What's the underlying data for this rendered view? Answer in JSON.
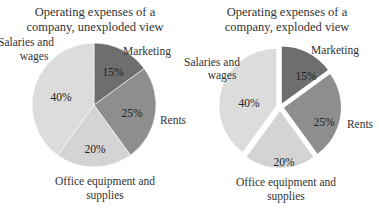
{
  "chart_data": [
    {
      "type": "pie",
      "title": "Operating expenses of a company, unexploded view",
      "title_lines": [
        "Operating expenses of a",
        "company, unexploded view"
      ],
      "exploded": false,
      "categories": [
        "Marketing",
        "Rents",
        "Office equipment and supplies",
        "Salaries and wages"
      ],
      "values": [
        15,
        25,
        20,
        40
      ],
      "value_labels": [
        "15%",
        "25%",
        "20%",
        "40%"
      ],
      "start_angle": "12 o'clock, clockwise",
      "legend": "none (data labels outside slices)"
    },
    {
      "type": "pie",
      "title": "Operating expenses of a company, exploded view",
      "title_lines": [
        "Operating expenses of a",
        "company, exploded view"
      ],
      "exploded": true,
      "categories": [
        "Marketing",
        "Rents",
        "Office equipment and supplies",
        "Salaries and wages"
      ],
      "values": [
        15,
        25,
        20,
        40
      ],
      "value_labels": [
        "15%",
        "25%",
        "20%",
        "40%"
      ],
      "start_angle": "12 o'clock, clockwise",
      "legend": "none (data labels outside slices)"
    }
  ],
  "colors": {
    "marketing": "#6e6e6e",
    "rents": "#8e8e8e",
    "office": "#d4d4d4",
    "salaries": "#dedede"
  },
  "labels": {
    "marketing": "Marketing",
    "rents": "Rents",
    "office_line1": "Office equipment and",
    "office_line2": "supplies",
    "salaries_line1": "Salaries and",
    "salaries_line2": "wages"
  }
}
